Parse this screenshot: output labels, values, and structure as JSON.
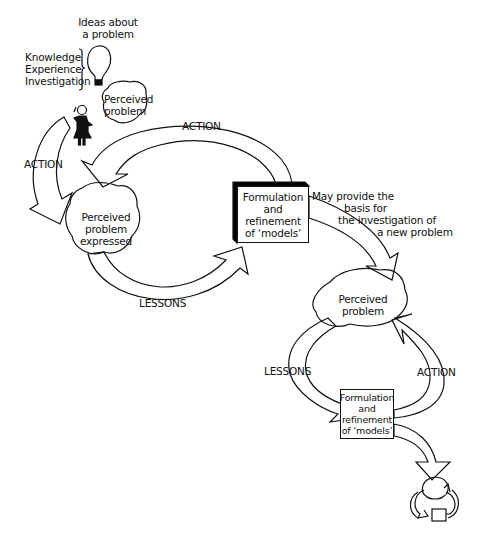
{
  "diagram": {
    "type": "learning-cycle",
    "colors": {
      "line": "#111111",
      "background": "#ffffff",
      "shadow": "#000000"
    },
    "idea": {
      "caption": [
        "Ideas about",
        "a problem"
      ],
      "icon": "lightbulb-icon"
    },
    "sources": [
      "Knowledge",
      "Experience",
      "Investigation"
    ],
    "person_icon": "person-thinking-icon",
    "top_cycle": {
      "perceived_problem": [
        "Perceived",
        "problem"
      ],
      "perceived_problem_expressed": [
        "Perceived",
        "problem",
        "expressed"
      ],
      "model_box": [
        "Formulation",
        "and",
        "refinement",
        "of ‘models’"
      ],
      "action_top_label": "ACTION",
      "action_left_label": "ACTION",
      "lessons_label": "LESSONS"
    },
    "link_note": [
      "May provide the",
      "basis for",
      "the investigation of",
      "a new problem"
    ],
    "bottom_cycle": {
      "perceived_problem": [
        "Perceived",
        "problem"
      ],
      "model_box": [
        "Formulation",
        "and",
        "refinement",
        "of ‘models’"
      ],
      "lessons_label": "LESSONS",
      "action_label": "ACTION"
    },
    "mini_cycle": {
      "icon": "mini-cycle-icon"
    }
  }
}
